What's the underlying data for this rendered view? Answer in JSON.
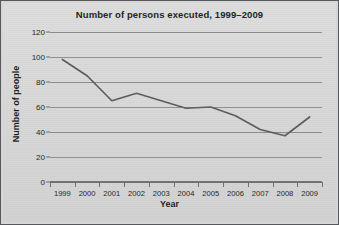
{
  "chart_data": {
    "type": "line",
    "title": "Number of persons executed, 1999–2009",
    "xlabel": "Year",
    "ylabel": "Number of people",
    "categories": [
      "1999",
      "2000",
      "2001",
      "2002",
      "2003",
      "2004",
      "2005",
      "2006",
      "2007",
      "2008",
      "2009"
    ],
    "values": [
      98,
      85,
      65,
      71,
      65,
      59,
      60,
      53,
      42,
      37,
      52
    ],
    "series": [
      {
        "name": "Number of people",
        "values": [
          98,
          85,
          65,
          71,
          65,
          59,
          60,
          53,
          42,
          37,
          52
        ]
      }
    ],
    "yticks": [
      0,
      20,
      40,
      60,
      80,
      100,
      120
    ],
    "ylim": [
      0,
      120
    ],
    "grid": "horizontal",
    "legend": "none",
    "line_color": "#5a5a5a",
    "background_color": "#d9d9d9",
    "gridline_color": "#8d8d8d",
    "text_color": "#1a1a1a"
  }
}
